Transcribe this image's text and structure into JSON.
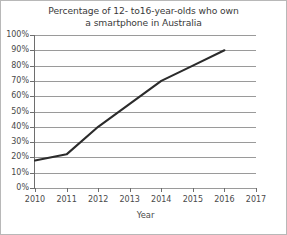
{
  "chart_data": {
    "type": "line",
    "title": "Percentage of 12- to16-year-olds who own a smartphone in Australia",
    "title_line1": "Percentage of 12- to16-year-olds who own",
    "title_line2": "a smartphone in Australia",
    "xlabel": "Year",
    "ylabel": "",
    "x": [
      2010,
      2011,
      2012,
      2013,
      2014,
      2015,
      2016
    ],
    "categories": [
      "2010",
      "2011",
      "2012",
      "2013",
      "2014",
      "2015",
      "2016"
    ],
    "values": [
      18,
      22,
      40,
      55,
      70,
      80,
      90
    ],
    "series": [
      {
        "name": "Smartphone ownership",
        "values": [
          18,
          22,
          40,
          55,
          70,
          80,
          90
        ]
      }
    ],
    "xlim": [
      2010,
      2017
    ],
    "ylim": [
      0,
      100
    ],
    "xticks": [
      "2010",
      "2011",
      "2012",
      "2013",
      "2014",
      "2015",
      "2016",
      "2017"
    ],
    "xtick_values": [
      2010,
      2011,
      2012,
      2013,
      2014,
      2015,
      2016,
      2017
    ],
    "yticks": [
      "0%",
      "10%",
      "20%",
      "30%",
      "40%",
      "50%",
      "60%",
      "70%",
      "80%",
      "90%",
      "100%"
    ],
    "ytick_values": [
      0,
      10,
      20,
      30,
      40,
      50,
      60,
      70,
      80,
      90,
      100
    ],
    "grid": true,
    "grid_axis": "y",
    "legend": false,
    "legend_position": "none",
    "line_color": "#2b2b2b",
    "grid_color": "#9a9a9a",
    "axis_color": "#6e6e6e",
    "text_color": "#4a4a4a",
    "background": "#ffffff"
  }
}
